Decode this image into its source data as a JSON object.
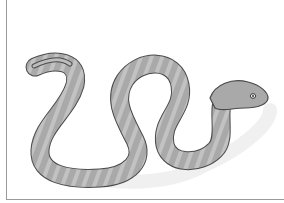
{
  "image": {
    "subject": "snake illustration",
    "alt": "Grayscale banded snake coiled in an S shape with head raised to the right",
    "colors": {
      "body": "#a9a9a9",
      "band_light": "#c4c4c4",
      "outline": "#4a4a4a",
      "shadow": "#e6e6e6",
      "frame": "#9a9a9a",
      "background": "#ffffff"
    }
  }
}
